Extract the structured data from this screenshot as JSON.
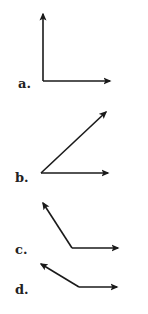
{
  "figures": [
    {
      "label": "a.",
      "label_pos": [
        18,
        88
      ],
      "vertex": [
        43,
        81
      ],
      "rays": [
        [
          43,
          14
        ],
        [
          110,
          81
        ]
      ],
      "angle_type": "right"
    },
    {
      "label": "b.",
      "label_pos": [
        15,
        182
      ],
      "vertex": [
        41,
        173
      ],
      "rays": [
        [
          106,
          112
        ],
        [
          108,
          173
        ]
      ],
      "angle_type": "acute"
    },
    {
      "label": "c.",
      "label_pos": [
        15,
        254
      ],
      "vertex": [
        72,
        248
      ],
      "rays": [
        [
          43,
          203
        ],
        [
          118,
          248
        ]
      ],
      "angle_type": "obtuse"
    },
    {
      "label": "d.",
      "label_pos": [
        15,
        294
      ],
      "vertex": [
        79,
        287
      ],
      "rays": [
        [
          41,
          264
        ],
        [
          117,
          287
        ]
      ],
      "angle_type": "obtuse"
    }
  ],
  "colors": {
    "stroke": "#1a1a1a",
    "label": "#222222",
    "background": "#ffffff"
  }
}
